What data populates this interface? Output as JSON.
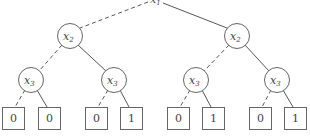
{
  "diagram": {
    "type": "binary-decision-tree",
    "legend": {
      "dashed_edge": "low (0) branch",
      "solid_edge": "high (1) branch"
    },
    "root": {
      "var": "x",
      "sub": "1"
    },
    "level2": [
      {
        "var": "x",
        "sub": "2"
      },
      {
        "var": "x",
        "sub": "2"
      }
    ],
    "level3": [
      {
        "var": "x",
        "sub": "3"
      },
      {
        "var": "x",
        "sub": "3"
      },
      {
        "var": "x",
        "sub": "3"
      },
      {
        "var": "x",
        "sub": "3"
      }
    ],
    "leaves": [
      "0",
      "0",
      "0",
      "1",
      "0",
      "1",
      "0",
      "1"
    ],
    "colors": {
      "stroke": "#666666",
      "text": "#444444",
      "background": "#ffffff"
    }
  }
}
